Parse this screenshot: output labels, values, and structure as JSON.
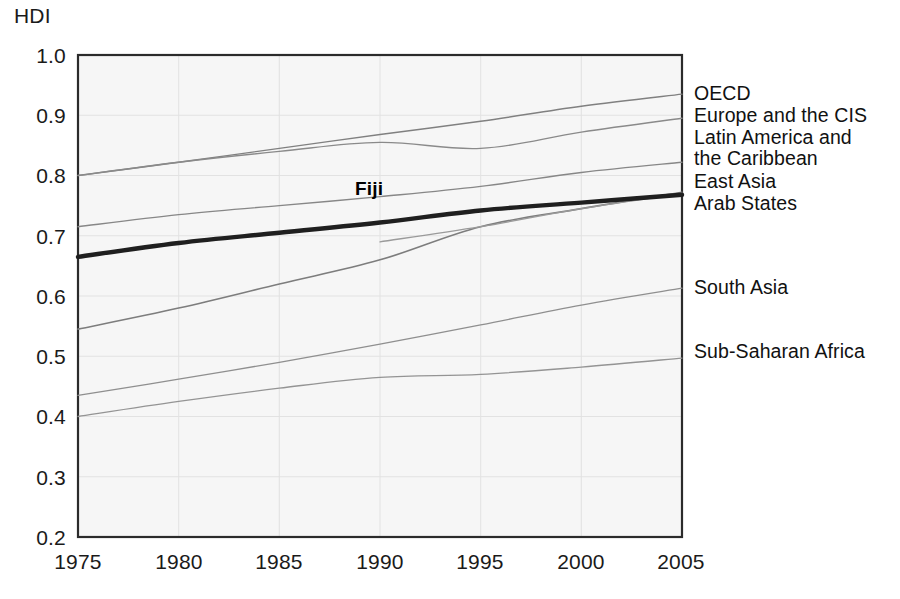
{
  "chart_data": {
    "type": "line",
    "title": "",
    "subtitle": "",
    "xlabel": "",
    "ylabel": "HDI",
    "ylabel_position": "top-left",
    "xlim": [
      1975,
      2005
    ],
    "ylim": [
      0.2,
      1.0
    ],
    "yticks": [
      "1.0",
      "0.9",
      "0.8",
      "0.7",
      "0.6",
      "0.5",
      "0.4",
      "0.3",
      "0.2"
    ],
    "ytick_values": [
      1.0,
      0.9,
      0.8,
      0.7,
      0.6,
      0.5,
      0.4,
      0.3,
      0.2
    ],
    "xticks": [
      "1975",
      "1980",
      "1985",
      "1990",
      "1995",
      "2000",
      "2005"
    ],
    "xtick_values": [
      1975,
      1980,
      1985,
      1990,
      1995,
      2000,
      2005
    ],
    "x": [
      1975,
      1980,
      1985,
      1990,
      1995,
      2000,
      2005
    ],
    "grid": true,
    "grid_style": "light gray horizontal and vertical gridlines",
    "legend": "inline right-side series labels",
    "legend_position": "right",
    "plot_background": "#f7f7f7",
    "series": [
      {
        "name": "OECD",
        "label": "OECD",
        "highlight": false,
        "color": "#808080",
        "width": 1.4,
        "x": [
          1975,
          1980,
          1985,
          1990,
          1995,
          2000,
          2005
        ],
        "values": [
          0.8,
          0.822,
          0.845,
          0.868,
          0.89,
          0.915,
          0.935
        ]
      },
      {
        "name": "Europe and the CIS",
        "label": "Europe and the CIS",
        "highlight": false,
        "color": "#8a8a8a",
        "width": 1.4,
        "x": [
          1975,
          1980,
          1985,
          1990,
          1995,
          2000,
          2005
        ],
        "values": [
          0.8,
          0.822,
          0.84,
          0.855,
          0.845,
          0.872,
          0.895
        ]
      },
      {
        "name": "Latin America and the Caribbean",
        "label": "Latin America and\nthe Caribbean",
        "highlight": false,
        "color": "#878787",
        "width": 1.4,
        "x": [
          1975,
          1980,
          1985,
          1990,
          1995,
          2000,
          2005
        ],
        "values": [
          0.715,
          0.735,
          0.75,
          0.765,
          0.782,
          0.805,
          0.822
        ]
      },
      {
        "name": "East Asia",
        "label": "East Asia",
        "highlight": false,
        "color": "#7d7d7d",
        "width": 1.6,
        "x": [
          1975,
          1980,
          1985,
          1990,
          1995,
          2000,
          2005
        ],
        "values": [
          0.545,
          0.58,
          0.62,
          0.66,
          0.715,
          0.745,
          0.772
        ]
      },
      {
        "name": "Arab States",
        "label": "Arab States",
        "highlight": false,
        "color": "#9a9a9a",
        "width": 1.3,
        "x": [
          1990,
          1995,
          2000,
          2005
        ],
        "values": [
          0.69,
          0.715,
          0.745,
          0.77
        ]
      },
      {
        "name": "Fiji",
        "label": "Fiji",
        "highlight": true,
        "color": "#1f1f1f",
        "width": 4.4,
        "x": [
          1975,
          1980,
          1985,
          1990,
          1995,
          2000,
          2005
        ],
        "values": [
          0.665,
          0.688,
          0.705,
          0.722,
          0.742,
          0.755,
          0.768
        ]
      },
      {
        "name": "South Asia",
        "label": "South Asia",
        "highlight": false,
        "color": "#8f8f8f",
        "width": 1.3,
        "x": [
          1975,
          1980,
          1985,
          1990,
          1995,
          2000,
          2005
        ],
        "values": [
          0.435,
          0.462,
          0.49,
          0.52,
          0.552,
          0.585,
          0.613
        ]
      },
      {
        "name": "Sub-Saharan Africa",
        "label": "Sub-Saharan Africa",
        "highlight": false,
        "color": "#949494",
        "width": 1.3,
        "x": [
          1975,
          1980,
          1985,
          1990,
          1995,
          2000,
          2005
        ],
        "values": [
          0.4,
          0.425,
          0.447,
          0.465,
          0.47,
          0.482,
          0.497
        ]
      }
    ],
    "annotations": [
      {
        "text": "Fiji",
        "x": 1989.5,
        "y": 0.793,
        "bold": true
      }
    ]
  },
  "right_labels": [
    {
      "text": "OECD"
    },
    {
      "text": "Europe and the CIS"
    },
    {
      "text": "Latin America and"
    },
    {
      "text": "the Caribbean"
    },
    {
      "text": "East Asia"
    },
    {
      "text": "Arab States"
    },
    {
      "text": "South Asia"
    },
    {
      "text": "Sub-Saharan Africa"
    }
  ]
}
